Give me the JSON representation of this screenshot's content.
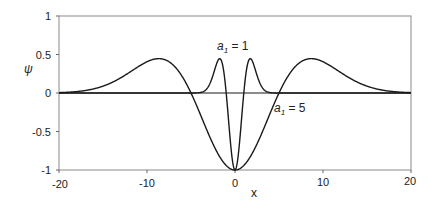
{
  "chart_data": {
    "type": "line",
    "title": "",
    "xlabel": "x",
    "ylabel": "ψ",
    "xlim": [
      -20,
      20
    ],
    "ylim": [
      -1,
      1
    ],
    "x_ticks": [
      "-20",
      "-10",
      "0",
      "10",
      "20"
    ],
    "y_ticks": [
      "1",
      "0.5",
      "0",
      "-0.5",
      "-1"
    ],
    "grid": false,
    "legend": null,
    "series": [
      {
        "name": "a1 = 1",
        "param": 1,
        "x": [
          -20,
          -5,
          -3,
          -2,
          -1.73,
          -1.5,
          -1,
          -0.5,
          0,
          0.5,
          1,
          1.5,
          1.73,
          2,
          3,
          5,
          20
        ],
        "values": [
          0,
          0.0,
          0.089,
          0.406,
          0.446,
          0.406,
          0,
          -0.662,
          -1,
          -0.662,
          0,
          0.406,
          0.446,
          0.406,
          0.089,
          0.0,
          0
        ]
      },
      {
        "name": "a1 = 5",
        "param": 5,
        "x": [
          -20,
          -15,
          -10,
          -8.66,
          -5,
          -2.5,
          0,
          2.5,
          5,
          8.66,
          10,
          15,
          20
        ],
        "values": [
          0.005,
          0.089,
          0.406,
          0.446,
          0,
          -0.662,
          -1,
          -0.662,
          0,
          0.446,
          0.406,
          0.089,
          0.005
        ]
      }
    ],
    "annotations": [
      {
        "text_main": "a",
        "text_sub": "1",
        "text_rest": " = 1",
        "near_x": 0,
        "near_y": 0.6
      },
      {
        "text_main": "a",
        "text_sub": "1",
        "text_rest": " = 5",
        "near_x": 4.5,
        "near_y": -0.2
      }
    ]
  },
  "labels": {
    "xlabel": "x",
    "ylabel": "ψ",
    "ann1_main": "a",
    "ann1_sub": "1",
    "ann1_rest": " = 1",
    "ann2_main": "a",
    "ann2_sub": "1",
    "ann2_rest": " = 5"
  },
  "colors": {
    "line": "#1a1a1a",
    "frame": "#888888",
    "zero_line": "#1a1a1a"
  }
}
